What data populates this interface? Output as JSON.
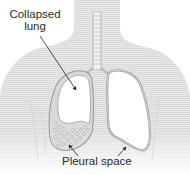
{
  "diagram": {
    "labels": {
      "collapsed_lung_line1": "Collapsed",
      "collapsed_lung_line2": "lung",
      "pleural_space": "Pleural space"
    },
    "parts": [
      "torso",
      "trachea",
      "left-lung-collapsed",
      "right-lung",
      "pleural-fluid"
    ],
    "colors": {
      "torso_fill": "#e6e6e6",
      "torso_stripe": "#d4d4d4",
      "outline": "#9a9a9a",
      "lung_fill": "#ffffff",
      "text": "#2a2a2a",
      "arrow": "#222222"
    }
  }
}
